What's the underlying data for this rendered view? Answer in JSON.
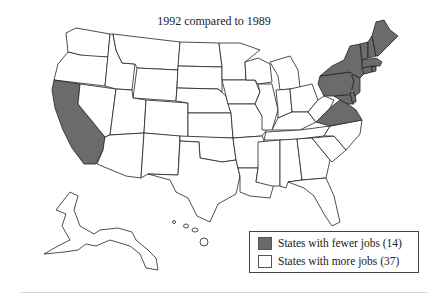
{
  "title": "1992 compared to 1989",
  "legend": {
    "items": [
      {
        "label": "States with fewer jobs (14)",
        "color": "#6b6b6b"
      },
      {
        "label": "States with more jobs (37)",
        "color": "#ffffff"
      }
    ]
  },
  "map": {
    "region": "United States",
    "states_fewer_jobs": [
      "California",
      "Virginia",
      "Maryland",
      "Delaware",
      "New Jersey",
      "Pennsylvania",
      "New York",
      "Connecticut",
      "Rhode Island",
      "Massachusetts",
      "Vermont",
      "New Hampshire",
      "Maine",
      "District of Columbia"
    ],
    "fewer_count": 14,
    "more_count": 37,
    "fewer_color": "#6b6b6b",
    "more_color": "#ffffff"
  }
}
